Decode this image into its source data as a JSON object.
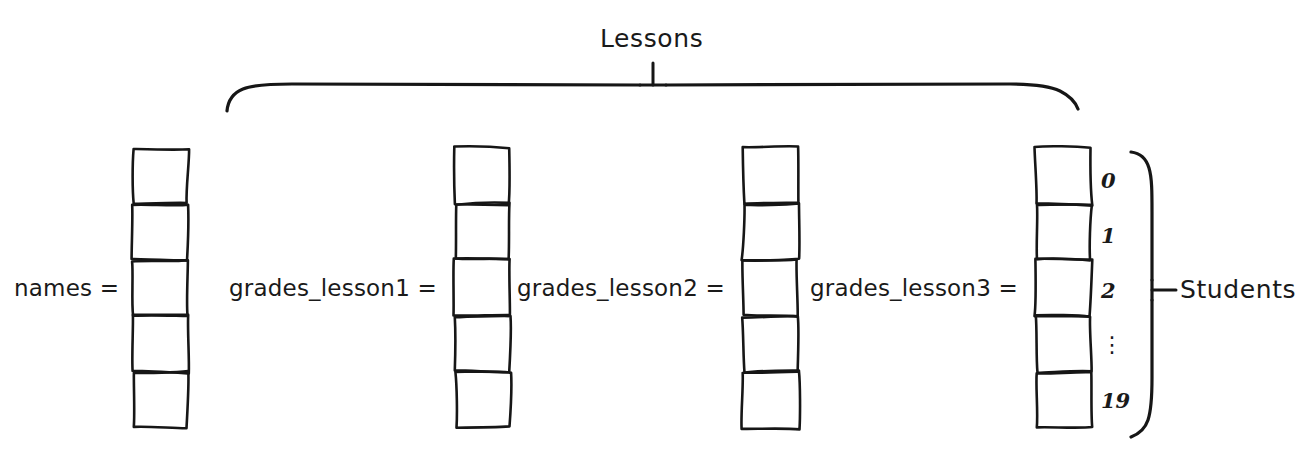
{
  "diagram": {
    "title_group_top": "Lessons",
    "title_group_right": "Students",
    "columns": [
      {
        "label": "names =",
        "name": "names",
        "x": 133,
        "width": 55,
        "label_x": 14,
        "cells": 5
      },
      {
        "label": "grades_lesson1 =",
        "name": "grades_lesson1",
        "x": 455,
        "width": 55,
        "label_x": 229,
        "cells": 5
      },
      {
        "label": "grades_lesson2 =",
        "name": "grades_lesson2",
        "x": 743,
        "width": 55,
        "label_x": 517,
        "cells": 5
      },
      {
        "label": "grades_lesson3 =",
        "name": "grades_lesson3",
        "x": 1036,
        "width": 55,
        "label_x": 810,
        "cells": 5
      }
    ],
    "index_labels": [
      "0",
      "1",
      "2",
      "⋮",
      "19"
    ],
    "index_positions": [
      180,
      235,
      290,
      345,
      400
    ],
    "column_top": 148,
    "column_bottom": 428,
    "cell_height": 56,
    "label_baseline_y": 288,
    "ink_color": "#161616",
    "background_color": "#ffffff"
  }
}
